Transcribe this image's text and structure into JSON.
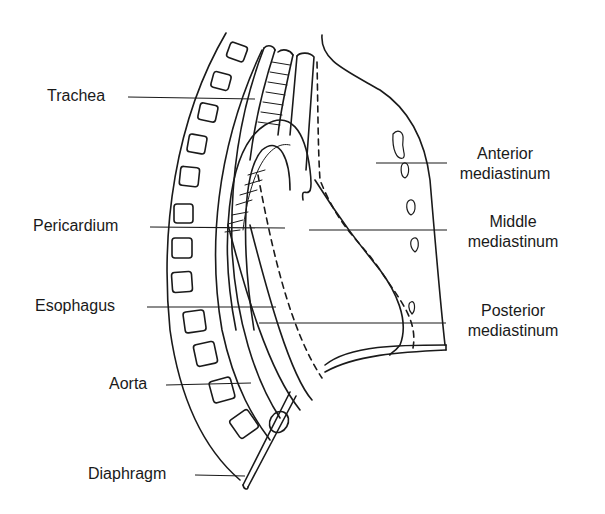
{
  "diagram": {
    "type": "anatomical-line-drawing",
    "colors": {
      "ink": "#1a1a1a",
      "background": "#ffffff"
    },
    "labels_left": [
      {
        "id": "trachea",
        "text": "Trachea"
      },
      {
        "id": "pericardium",
        "text": "Pericardium"
      },
      {
        "id": "esophagus",
        "text": "Esophagus"
      },
      {
        "id": "aorta",
        "text": "Aorta"
      },
      {
        "id": "diaphragm",
        "text": "Diaphragm"
      }
    ],
    "labels_right": [
      {
        "id": "anterior",
        "line1": "Anterior",
        "line2": "mediastinum"
      },
      {
        "id": "middle",
        "line1": "Middle",
        "line2": "mediastinum"
      },
      {
        "id": "posterior",
        "line1": "Posterior",
        "line2": "mediastinum"
      }
    ]
  }
}
